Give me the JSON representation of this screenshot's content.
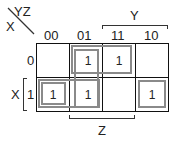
{
  "kmap": {
    "corner": {
      "col_var": "YZ",
      "row_var": "X"
    },
    "col_headers": [
      "00",
      "01",
      "11",
      "10"
    ],
    "row_headers": [
      "0",
      "1"
    ],
    "cells": [
      [
        "",
        "1",
        "1",
        ""
      ],
      [
        "1",
        "1",
        "",
        "1"
      ]
    ],
    "brackets": {
      "top": "Y",
      "bottom": "Z",
      "left": "X"
    },
    "colors": {
      "grid": "#111111",
      "group": "#8a8a8a",
      "text": "#222222"
    }
  }
}
